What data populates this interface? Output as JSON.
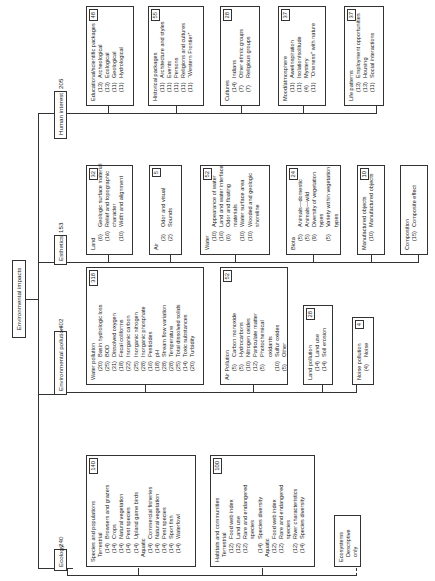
{
  "root": {
    "label": "Environmental impacts"
  },
  "categories": [
    {
      "label": "Ecology",
      "total": "240",
      "groups": [
        {
          "title": "Species and populations",
          "total": "140",
          "sections": [
            {
              "label": "Terrestrial",
              "items": [
                {
                  "w": "(14)",
                  "t": "Browsers and grazers"
                },
                {
                  "w": "(14)",
                  "t": "Crops"
                },
                {
                  "w": "(14)",
                  "t": "Natural vegetation"
                },
                {
                  "w": "(14)",
                  "t": "Pest species"
                },
                {
                  "w": "(14)",
                  "t": "Upland game birds"
                }
              ]
            },
            {
              "label": "Aquatic",
              "items": [
                {
                  "w": "(14)",
                  "t": "Commercial fisheries"
                },
                {
                  "w": "(14)",
                  "t": "Natural vegetation"
                },
                {
                  "w": "(14)",
                  "t": "Pest species"
                },
                {
                  "w": "(14)",
                  "t": "Sport fish"
                },
                {
                  "w": "(14)",
                  "t": "Waterfowl"
                }
              ]
            }
          ]
        },
        {
          "title": "Habitats and communities",
          "total": "100",
          "sections": [
            {
              "label": "Terrestrial",
              "items": [
                {
                  "w": "(12)",
                  "t": "Food web index"
                },
                {
                  "w": "(12)",
                  "t": "Land use"
                },
                {
                  "w": "(12)",
                  "t": "Rare and endangered",
                  "c": "species"
                },
                {
                  "w": "(14)",
                  "t": "Species diversity"
                }
              ]
            },
            {
              "label": "Aquatic",
              "items": [
                {
                  "w": "(12)",
                  "t": "Food web index"
                },
                {
                  "w": "(12)",
                  "t": "Rare and endangered",
                  "c": "species"
                },
                {
                  "w": "(12)",
                  "t": "River characteristics"
                },
                {
                  "w": "(14)",
                  "t": "Species diversity"
                }
              ]
            }
          ]
        },
        {
          "title": "Ecosystems",
          "sections": [
            {
              "label": "Descriptive only",
              "items": []
            }
          ]
        }
      ]
    },
    {
      "label": "Environmental pollution",
      "total": "402",
      "groups": [
        {
          "title": "Water pollution",
          "total": "318",
          "items": [
            {
              "w": "(20)",
              "t": "Basin hydrologic loss"
            },
            {
              "w": "(25)",
              "t": "BOD"
            },
            {
              "w": "(31)",
              "t": "Dissolved oxygen"
            },
            {
              "w": "(18)",
              "t": "Fecal coliforms"
            },
            {
              "w": "(22)",
              "t": "Inorganic carbon"
            },
            {
              "w": "(25)",
              "t": "Inorganic nitrogen"
            },
            {
              "w": "(28)",
              "t": "Inorganic phosphate"
            },
            {
              "w": "(16)",
              "t": "Pesticides"
            },
            {
              "w": "(18)",
              "t": "pH"
            },
            {
              "w": "(28)",
              "t": "Stream flow variation"
            },
            {
              "w": "(28)",
              "t": "Temperature"
            },
            {
              "w": "(25)",
              "t": "Total dissolved solids"
            },
            {
              "w": "(14)",
              "t": "Toxic substances"
            },
            {
              "w": "(20)",
              "t": "Turbidity"
            }
          ]
        },
        {
          "title": "Air Pollution",
          "total": "52",
          "items": [
            {
              "w": "(5)",
              "t": "Carbon monoxide"
            },
            {
              "w": "(5)",
              "t": "Hydrocarbons"
            },
            {
              "w": "(10)",
              "t": "Nitrogen oxides"
            },
            {
              "w": "(12)",
              "t": "Particulate matter"
            },
            {
              "w": "(5)",
              "t": "Photochemical",
              "c": "oxidants"
            },
            {
              "w": "(10)",
              "t": "Sulfur oxides"
            },
            {
              "w": "(5)",
              "t": "Other"
            }
          ]
        },
        {
          "title": "Land pollution",
          "total": "28",
          "items": [
            {
              "w": "(14)",
              "t": "Land use"
            },
            {
              "w": "(14)",
              "t": "Soil erosion"
            }
          ]
        },
        {
          "title": "Noise pollution",
          "total": "4",
          "items": [
            {
              "w": "(4)",
              "t": "Noise"
            }
          ]
        }
      ]
    },
    {
      "label": "Esthetics",
      "total": "153",
      "groups": [
        {
          "title": "Land",
          "total": "32",
          "items": [
            {
              "w": "(6)",
              "t": "Geologic surface material"
            },
            {
              "w": "(16)",
              "t": "Relief and topographic",
              "c": "character"
            },
            {
              "w": "(10)",
              "t": "Width and alignment"
            }
          ]
        },
        {
          "title": "Air",
          "total": "5",
          "items": [
            {
              "w": "(3)",
              "t": "Odor and visual"
            },
            {
              "w": "(2)",
              "t": "Sounds"
            }
          ]
        },
        {
          "title": "Water",
          "total": "52",
          "items": [
            {
              "w": "(10)",
              "t": "Appearance of water"
            },
            {
              "w": "(16)",
              "t": "Land and water interface"
            },
            {
              "w": "(6)",
              "t": "Odor and floating",
              "c": "materials"
            },
            {
              "w": "(10)",
              "t": "Water surface area"
            },
            {
              "w": "(10)",
              "t": "Wooded and geologic",
              "c": "shoreline"
            }
          ]
        },
        {
          "title": "Biota",
          "total": "24",
          "items": [
            {
              "w": "(5)",
              "t": "Animals—domestic"
            },
            {
              "w": "(5)",
              "t": "Animals—wild"
            },
            {
              "w": "(9)",
              "t": "Diversity of vegetation",
              "c": "types"
            },
            {
              "w": "(5)",
              "t": "Variety within vegetation",
              "c": "types"
            }
          ]
        },
        {
          "title": "Manufactured objects",
          "total": "10",
          "items": [
            {
              "w": "(10)",
              "t": "Manufactured objects"
            }
          ]
        },
        {
          "title": "Composition",
          "items": [
            {
              "w": "(15)",
              "t": "Composite effect"
            }
          ]
        }
      ]
    },
    {
      "label": "Human interest",
      "total": "205",
      "groups": [
        {
          "title": "Educational/scientific packages",
          "total": "48",
          "items": [
            {
              "w": "(13)",
              "t": "Archeological"
            },
            {
              "w": "(13)",
              "t": "Ecological"
            },
            {
              "w": "(11)",
              "t": "Geological"
            },
            {
              "w": "(11)",
              "t": "Hydrological"
            }
          ]
        },
        {
          "title": "Historical packages",
          "total": "55",
          "items": [
            {
              "w": "(11)",
              "t": "Architecture and styles"
            },
            {
              "w": "(11)",
              "t": "Events"
            },
            {
              "w": "(11)",
              "t": "Persons"
            },
            {
              "w": "(11)",
              "t": "Religions and cultures"
            },
            {
              "w": "(11)",
              "t": "“Western Frontier”"
            }
          ]
        },
        {
          "title": "Cultures",
          "total": "28",
          "items": [
            {
              "w": "(14)",
              "t": "Indians"
            },
            {
              "w": "(7)",
              "t": "Other ethnic groups"
            },
            {
              "w": "(7)",
              "t": "Religious groups"
            }
          ]
        },
        {
          "title": "Mood/atmosphere",
          "total": "37",
          "items": [
            {
              "w": "(11)",
              "t": "Awe/inspiration"
            },
            {
              "w": "(11)",
              "t": "Isolation/solitude"
            },
            {
              "w": "(4)",
              "t": "Mystery"
            },
            {
              "w": "(11)",
              "t": "“Oneness” with nature"
            }
          ]
        },
        {
          "title": "Life patterns",
          "total": "37",
          "items": [
            {
              "w": "(13)",
              "t": "Employment opportunities"
            },
            {
              "w": "(13)",
              "t": "Housing"
            },
            {
              "w": "(11)",
              "t": "Social interactions"
            }
          ]
        }
      ]
    }
  ]
}
